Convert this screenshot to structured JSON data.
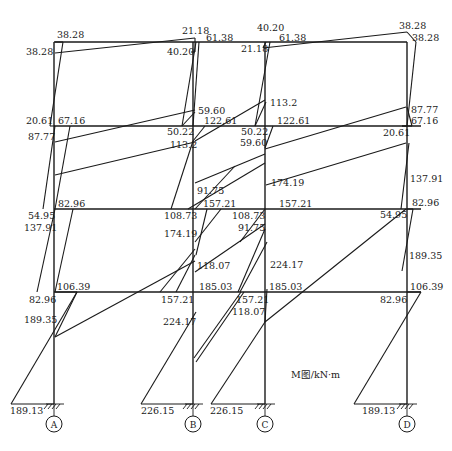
{
  "diagram": {
    "title": "M图/kN·m",
    "axes": [
      {
        "label": "A",
        "x": 54
      },
      {
        "label": "B",
        "x": 193
      },
      {
        "label": "C",
        "x": 265
      },
      {
        "label": "D",
        "x": 407
      }
    ],
    "floors_y": [
      42,
      126,
      209,
      292,
      404
    ],
    "moment_lines": [
      [
        55,
        42,
        63,
        42
      ],
      [
        55,
        53,
        195,
        38
      ],
      [
        195,
        38,
        195,
        52
      ],
      [
        195,
        52,
        191,
        52
      ],
      [
        199,
        42,
        193,
        126
      ],
      [
        266,
        42,
        263,
        48
      ],
      [
        263,
        48,
        407,
        32
      ],
      [
        407,
        32,
        416,
        42
      ],
      [
        416,
        42,
        407,
        126
      ],
      [
        407,
        126,
        402,
        126
      ],
      [
        55,
        126,
        50,
        126
      ],
      [
        50,
        126,
        63,
        42
      ],
      [
        70,
        126,
        55,
        209
      ],
      [
        55,
        142,
        195,
        110
      ],
      [
        195,
        112,
        182,
        126
      ],
      [
        182,
        126,
        196,
        42
      ],
      [
        195,
        141,
        265,
        100
      ],
      [
        266,
        102,
        255,
        126
      ],
      [
        255,
        126,
        270,
        42
      ],
      [
        265,
        149,
        406,
        107
      ],
      [
        407,
        107,
        412,
        126
      ],
      [
        412,
        126,
        402,
        126
      ],
      [
        205,
        126,
        193,
        141
      ],
      [
        273,
        126,
        265,
        148
      ],
      [
        43,
        209,
        55,
        126
      ],
      [
        73,
        209,
        55,
        292
      ],
      [
        55,
        175,
        195,
        142
      ],
      [
        171,
        209,
        193,
        141
      ],
      [
        195,
        209,
        235,
        166
      ],
      [
        265,
        163,
        188,
        209
      ],
      [
        195,
        183,
        265,
        154
      ],
      [
        221,
        209,
        195,
        242
      ],
      [
        265,
        209,
        240,
        242
      ],
      [
        266,
        185,
        406,
        143
      ],
      [
        409,
        143,
        401,
        209
      ],
      [
        207,
        209,
        196,
        255
      ],
      [
        176,
        292,
        195,
        255
      ],
      [
        195,
        272,
        265,
        224
      ],
      [
        265,
        229,
        238,
        292
      ],
      [
        240,
        292,
        267,
        242
      ],
      [
        37,
        292,
        55,
        209
      ],
      [
        55,
        292,
        77,
        292
      ],
      [
        77,
        292,
        55,
        337
      ],
      [
        55,
        337,
        195,
        261
      ],
      [
        160,
        292,
        195,
        249
      ],
      [
        265,
        322,
        406,
        209
      ],
      [
        407,
        209,
        413,
        209
      ],
      [
        413,
        209,
        402,
        271
      ],
      [
        265,
        322,
        267,
        289
      ],
      [
        407,
        292,
        421,
        292
      ],
      [
        421,
        292,
        354,
        404
      ],
      [
        11,
        404,
        77,
        292
      ],
      [
        141,
        404,
        196,
        312
      ],
      [
        211,
        404,
        265,
        322
      ],
      [
        141,
        404,
        193,
        404
      ],
      [
        11,
        404,
        54,
        404
      ],
      [
        211,
        404,
        265,
        404
      ],
      [
        354,
        404,
        407,
        404
      ],
      [
        241,
        292,
        194,
        358
      ],
      [
        244,
        292,
        196,
        362
      ]
    ],
    "labels": [
      {
        "text": "38.28",
        "x": 57,
        "y": 38
      },
      {
        "text": "38.28",
        "x": 26,
        "y": 55
      },
      {
        "text": "21.18",
        "x": 182,
        "y": 34
      },
      {
        "text": "61.38",
        "x": 206,
        "y": 41
      },
      {
        "text": "40.20",
        "x": 167,
        "y": 55
      },
      {
        "text": "40.20",
        "x": 257,
        "y": 31
      },
      {
        "text": "61.38",
        "x": 279,
        "y": 41
      },
      {
        "text": "21.18",
        "x": 241,
        "y": 52
      },
      {
        "text": "38.28",
        "x": 399,
        "y": 29
      },
      {
        "text": "38.28",
        "x": 412,
        "y": 41
      },
      {
        "text": "20.61",
        "x": 26,
        "y": 124
      },
      {
        "text": "67.16",
        "x": 58,
        "y": 124
      },
      {
        "text": "87.77",
        "x": 28,
        "y": 140
      },
      {
        "text": "59.60",
        "x": 198,
        "y": 114
      },
      {
        "text": "50.22",
        "x": 167,
        "y": 135
      },
      {
        "text": "122.61",
        "x": 204,
        "y": 124
      },
      {
        "text": "113.2",
        "x": 170,
        "y": 148
      },
      {
        "text": "113.2",
        "x": 270,
        "y": 106
      },
      {
        "text": "50.22",
        "x": 241,
        "y": 135
      },
      {
        "text": "122.61",
        "x": 277,
        "y": 124
      },
      {
        "text": "59.60",
        "x": 240,
        "y": 146
      },
      {
        "text": "87.77",
        "x": 411,
        "y": 113
      },
      {
        "text": "67.16",
        "x": 411,
        "y": 124
      },
      {
        "text": "20.61",
        "x": 383,
        "y": 136
      },
      {
        "text": "91.75",
        "x": 197,
        "y": 194
      },
      {
        "text": "82.96",
        "x": 58,
        "y": 207
      },
      {
        "text": "54.95",
        "x": 28,
        "y": 219
      },
      {
        "text": "137.91",
        "x": 24,
        "y": 231
      },
      {
        "text": "108.73",
        "x": 164,
        "y": 219
      },
      {
        "text": "157.21",
        "x": 203,
        "y": 207
      },
      {
        "text": "174.19",
        "x": 164,
        "y": 237
      },
      {
        "text": "174.19",
        "x": 271,
        "y": 186
      },
      {
        "text": "108.73",
        "x": 232,
        "y": 219
      },
      {
        "text": "157.21",
        "x": 279,
        "y": 207
      },
      {
        "text": "91.75",
        "x": 238,
        "y": 231
      },
      {
        "text": "137.91",
        "x": 410,
        "y": 182
      },
      {
        "text": "82.96",
        "x": 412,
        "y": 206
      },
      {
        "text": "54.95",
        "x": 380,
        "y": 218
      },
      {
        "text": "118.07",
        "x": 197,
        "y": 269
      },
      {
        "text": "224.17",
        "x": 270,
        "y": 268
      },
      {
        "text": "189.35",
        "x": 409,
        "y": 259
      },
      {
        "text": "106.39",
        "x": 57,
        "y": 290
      },
      {
        "text": "82.96",
        "x": 29,
        "y": 303
      },
      {
        "text": "189.35",
        "x": 24,
        "y": 323
      },
      {
        "text": "185.03",
        "x": 199,
        "y": 290
      },
      {
        "text": "157.21",
        "x": 161,
        "y": 303
      },
      {
        "text": "224.17",
        "x": 163,
        "y": 325
      },
      {
        "text": "185.03",
        "x": 269,
        "y": 290
      },
      {
        "text": "157.21",
        "x": 236,
        "y": 303
      },
      {
        "text": "118.07",
        "x": 232,
        "y": 315
      },
      {
        "text": "106.39",
        "x": 410,
        "y": 290
      },
      {
        "text": "82.96",
        "x": 380,
        "y": 303
      },
      {
        "text": "189.13",
        "x": 10,
        "y": 414
      },
      {
        "text": "226.15",
        "x": 141,
        "y": 414
      },
      {
        "text": "226.15",
        "x": 210,
        "y": 414
      },
      {
        "text": "189.13",
        "x": 362,
        "y": 414
      }
    ]
  }
}
